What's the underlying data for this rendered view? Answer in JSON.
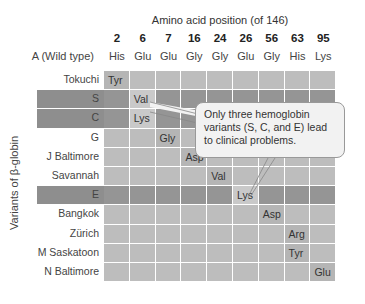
{
  "header": {
    "axis_title": "Amino acid position (of 146)",
    "positions": [
      "2",
      "6",
      "7",
      "16",
      "24",
      "26",
      "56",
      "63",
      "95"
    ],
    "wild_type_label": "A (Wild type)",
    "wild_type_residues": [
      "His",
      "Glu",
      "Glu",
      "Gly",
      "Gly",
      "Glu",
      "Gly",
      "His",
      "Lys"
    ]
  },
  "y_axis_label": "Variants of β-globin",
  "variants": [
    {
      "name": "Tokuchi",
      "highlight": false,
      "col": 0,
      "residue": "Tyr"
    },
    {
      "name": "S",
      "highlight": true,
      "col": 1,
      "residue": "Val"
    },
    {
      "name": "C",
      "highlight": true,
      "col": 1,
      "residue": "Lys"
    },
    {
      "name": "G",
      "highlight": false,
      "col": 2,
      "residue": "Gly"
    },
    {
      "name": "J Baltimore",
      "highlight": false,
      "col": 3,
      "residue": "Asp"
    },
    {
      "name": "Savannah",
      "highlight": false,
      "col": 4,
      "residue": "Val"
    },
    {
      "name": "E",
      "highlight": true,
      "col": 5,
      "residue": "Lys"
    },
    {
      "name": "Bangkok",
      "highlight": false,
      "col": 6,
      "residue": "Asp"
    },
    {
      "name": "Zürich",
      "highlight": false,
      "col": 7,
      "residue": "Arg"
    },
    {
      "name": "M Saskatoon",
      "highlight": false,
      "col": 7,
      "residue": "Tyr"
    },
    {
      "name": "N Baltimore",
      "highlight": false,
      "col": 8,
      "residue": "Glu"
    }
  ],
  "callout": {
    "text": "Only three hemoglobin variants (S, C, and E) lead to clinical problems."
  },
  "colors": {
    "cell": "#bdbdbd",
    "highlight_row": "#8e8e8e",
    "changed_cell": "#c9c9c9"
  }
}
